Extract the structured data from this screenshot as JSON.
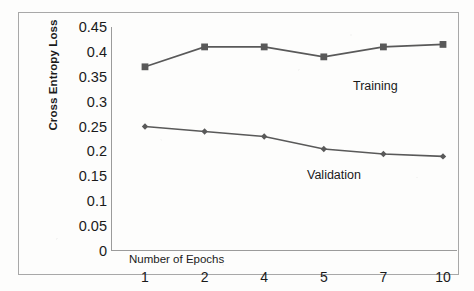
{
  "chart_data": {
    "type": "line",
    "title": "",
    "xlabel": "Number  of Epochs",
    "ylabel": "Cross Entropy Loss",
    "categories": [
      "1",
      "2",
      "4",
      "5",
      "7",
      "10"
    ],
    "x_tick_labels": [
      "1",
      "2",
      "4",
      "5",
      "7",
      "10"
    ],
    "y_tick_labels": [
      "0.45",
      "0.4",
      "0.35",
      "0.3",
      "0.25",
      "0.2",
      "0.15",
      "0.1",
      "0.05",
      "0"
    ],
    "y_tick_values": [
      0.45,
      0.4,
      0.35,
      0.3,
      0.25,
      0.2,
      0.15,
      0.1,
      0.05,
      0
    ],
    "ylim": [
      0,
      0.45
    ],
    "grid": false,
    "legend_position": "inline-annotations",
    "series": [
      {
        "name": "Training",
        "marker": "square",
        "color": "#595959",
        "values": [
          0.37,
          0.41,
          0.41,
          0.39,
          0.41,
          0.415
        ]
      },
      {
        "name": "Validation",
        "marker": "diamond",
        "color": "#595959",
        "values": [
          0.25,
          0.24,
          0.23,
          0.205,
          0.195,
          0.19
        ]
      }
    ],
    "annotations": [
      {
        "text": "Training",
        "series": "Training"
      },
      {
        "text": "Validation",
        "series": "Validation"
      }
    ],
    "colors": {
      "line": "#595959",
      "axis": "#9b9b9b",
      "frame": "#a8a8a8",
      "text": "#1a1a1a",
      "background": "#fdfdfc"
    }
  }
}
